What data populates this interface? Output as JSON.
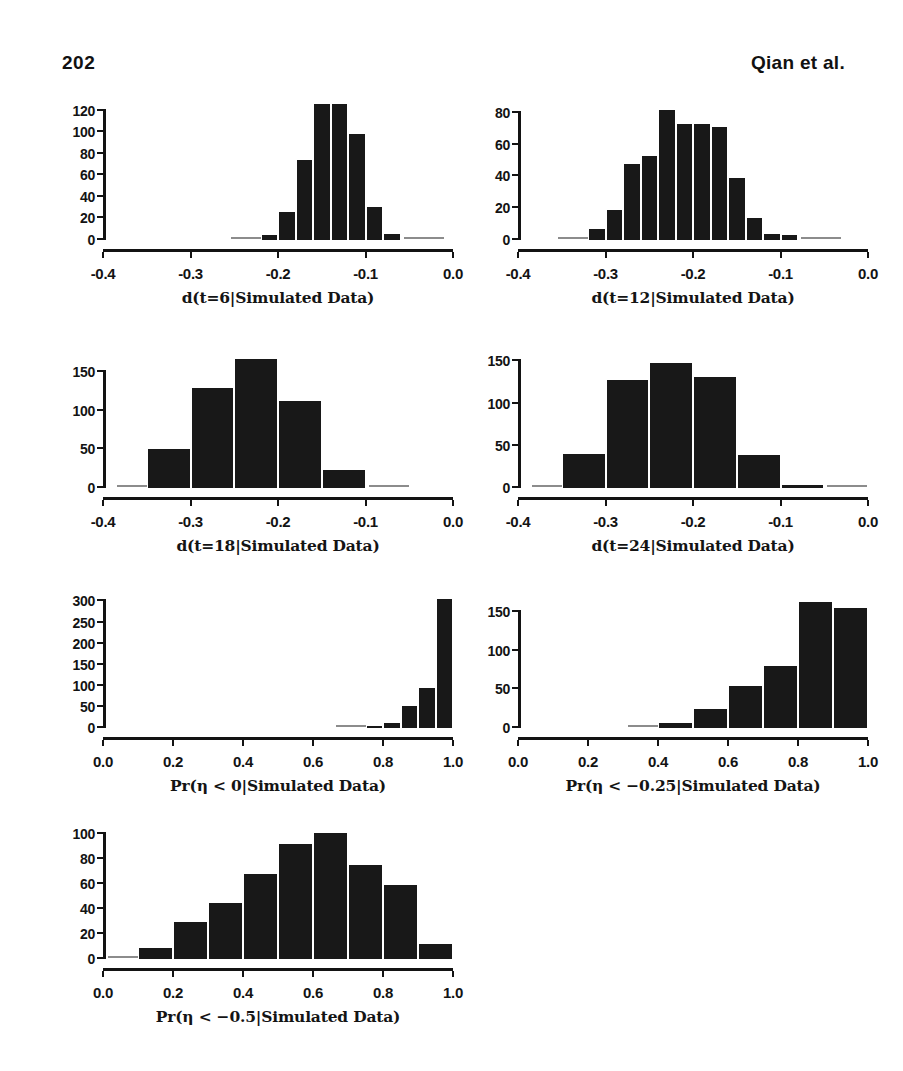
{
  "page": {
    "number": "202",
    "running_head": "Qian et al."
  },
  "chart_data": [
    {
      "id": "panel-1",
      "type": "bar",
      "title": "",
      "xlabel": "d(t=6|Simulated Data)",
      "ylabel": "",
      "xlim": [
        -0.4,
        0.0
      ],
      "ylim": [
        0,
        130
      ],
      "xticks": [
        -0.4,
        -0.3,
        -0.2,
        -0.1,
        0.0
      ],
      "xticklabels": [
        "-0.4",
        "-0.3",
        "-0.2",
        "-0.1",
        "0.0"
      ],
      "yticks": [
        0,
        20,
        40,
        60,
        80,
        100,
        120
      ],
      "yticklabels": [
        "0",
        "20",
        "40",
        "60",
        "80",
        "100",
        "120"
      ],
      "bin_width": 0.02,
      "bin_starts": [
        -0.22,
        -0.2,
        -0.18,
        -0.16,
        -0.14,
        -0.12,
        -0.1,
        -0.08
      ],
      "values": [
        5,
        26,
        74,
        126,
        126,
        98,
        31,
        6
      ],
      "grid": false,
      "legend": null
    },
    {
      "id": "panel-2",
      "type": "bar",
      "title": "",
      "xlabel": "d(t=12|Simulated Data)",
      "ylabel": "",
      "xlim": [
        -0.4,
        0.0
      ],
      "ylim": [
        0,
        88
      ],
      "xticks": [
        -0.4,
        -0.3,
        -0.2,
        -0.1,
        0.0
      ],
      "xticklabels": [
        "-0.4",
        "-0.3",
        "-0.2",
        "-0.1",
        "0.0"
      ],
      "yticks": [
        0,
        20,
        40,
        60,
        80
      ],
      "yticklabels": [
        "0",
        "20",
        "40",
        "60",
        "80"
      ],
      "bin_width": 0.02,
      "bin_starts": [
        -0.32,
        -0.3,
        -0.28,
        -0.26,
        -0.24,
        -0.22,
        -0.2,
        -0.18,
        -0.16,
        -0.14,
        -0.12,
        -0.1
      ],
      "values": [
        7,
        19,
        48,
        53,
        82,
        73,
        73,
        71,
        39,
        14,
        4,
        3
      ],
      "grid": false,
      "legend": null
    },
    {
      "id": "panel-3",
      "type": "bar",
      "title": "",
      "xlabel": "d(t=18|Simulated Data)",
      "ylabel": "",
      "xlim": [
        -0.4,
        0.0
      ],
      "ylim": [
        0,
        175
      ],
      "xticks": [
        -0.4,
        -0.3,
        -0.2,
        -0.1,
        0.0
      ],
      "xticklabels": [
        "-0.4",
        "-0.3",
        "-0.2",
        "-0.1",
        "0.0"
      ],
      "yticks": [
        0,
        50,
        100,
        150
      ],
      "yticklabels": [
        "0",
        "50",
        "100",
        "150"
      ],
      "bin_width": 0.05,
      "bin_starts": [
        -0.35,
        -0.3,
        -0.25,
        -0.2,
        -0.15
      ],
      "values": [
        50,
        130,
        167,
        113,
        23
      ],
      "grid": false,
      "legend": null
    },
    {
      "id": "panel-4",
      "type": "bar",
      "title": "",
      "xlabel": "d(t=24|Simulated Data)",
      "ylabel": "",
      "xlim": [
        -0.4,
        0.0
      ],
      "ylim": [
        0,
        160
      ],
      "xticks": [
        -0.4,
        -0.3,
        -0.2,
        -0.1,
        0.0
      ],
      "xticklabels": [
        "-0.4",
        "-0.3",
        "-0.2",
        "-0.1",
        "0.0"
      ],
      "yticks": [
        0,
        50,
        100,
        150
      ],
      "yticklabels": [
        "0",
        "50",
        "100",
        "150"
      ],
      "bin_width": 0.05,
      "bin_starts": [
        -0.35,
        -0.3,
        -0.25,
        -0.2,
        -0.15,
        -0.1
      ],
      "values": [
        40,
        128,
        148,
        131,
        39,
        3
      ],
      "grid": false,
      "legend": null
    },
    {
      "id": "panel-5",
      "type": "bar",
      "title": "",
      "xlabel": "Pr(η < 0|Simulated Data)",
      "ylabel": "",
      "xlim": [
        0.0,
        1.0
      ],
      "ylim": [
        0,
        320
      ],
      "xticks": [
        0.0,
        0.2,
        0.4,
        0.6,
        0.8,
        1.0
      ],
      "xticklabels": [
        "0.0",
        "0.2",
        "0.4",
        "0.6",
        "0.8",
        "1.0"
      ],
      "yticks": [
        0,
        50,
        100,
        150,
        200,
        250,
        300
      ],
      "yticklabels": [
        "0",
        "50",
        "100",
        "150",
        "200",
        "250",
        "300"
      ],
      "bin_width": 0.05,
      "bin_starts": [
        0.75,
        0.8,
        0.85,
        0.9,
        0.95
      ],
      "values": [
        5,
        13,
        53,
        95,
        305
      ],
      "grid": false,
      "legend": null
    },
    {
      "id": "panel-6",
      "type": "bar",
      "title": "",
      "xlabel": "Pr(η < −0.25|Simulated Data)",
      "ylabel": "",
      "xlim": [
        0.0,
        1.0
      ],
      "ylim": [
        0,
        175
      ],
      "xticks": [
        0.0,
        0.2,
        0.4,
        0.6,
        0.8,
        1.0
      ],
      "xticklabels": [
        "0.0",
        "0.2",
        "0.4",
        "0.6",
        "0.8",
        "1.0"
      ],
      "yticks": [
        0,
        50,
        100,
        150
      ],
      "yticklabels": [
        "0",
        "50",
        "100",
        "150"
      ],
      "bin_width": 0.1,
      "bin_starts": [
        0.4,
        0.5,
        0.6,
        0.7,
        0.8,
        0.9
      ],
      "values": [
        6,
        25,
        54,
        81,
        164,
        155
      ],
      "grid": false,
      "legend": null
    },
    {
      "id": "panel-7",
      "type": "bar",
      "title": "",
      "xlabel": "Pr(η < −0.5|Simulated Data)",
      "ylabel": "",
      "xlim": [
        0.0,
        1.0
      ],
      "ylim": [
        0,
        108
      ],
      "xticks": [
        0.0,
        0.2,
        0.4,
        0.6,
        0.8,
        1.0
      ],
      "xticklabels": [
        "0.0",
        "0.2",
        "0.4",
        "0.6",
        "0.8",
        "1.0"
      ],
      "yticks": [
        0,
        20,
        40,
        60,
        80,
        100
      ],
      "yticklabels": [
        "0",
        "20",
        "40",
        "60",
        "80",
        "100"
      ],
      "bin_width": 0.1,
      "bin_starts": [
        0.1,
        0.2,
        0.3,
        0.4,
        0.5,
        0.6,
        0.7,
        0.8,
        0.9
      ],
      "values": [
        9,
        30,
        45,
        68,
        92,
        101,
        75,
        59,
        12
      ],
      "grid": false,
      "legend": null
    }
  ],
  "layout": {
    "panels": [
      {
        "id": "panel-1",
        "left": 55,
        "top": 100,
        "plot_w": 350,
        "plot_h": 140
      },
      {
        "id": "panel-2",
        "left": 470,
        "top": 100,
        "plot_w": 350,
        "plot_h": 140
      },
      {
        "id": "panel-3",
        "left": 55,
        "top": 353,
        "plot_w": 350,
        "plot_h": 135
      },
      {
        "id": "panel-4",
        "left": 470,
        "top": 353,
        "plot_w": 350,
        "plot_h": 135
      },
      {
        "id": "panel-5",
        "left": 55,
        "top": 593,
        "plot_w": 350,
        "plot_h": 135
      },
      {
        "id": "panel-6",
        "left": 470,
        "top": 593,
        "plot_w": 350,
        "plot_h": 135
      },
      {
        "id": "panel-7",
        "left": 55,
        "top": 824,
        "plot_w": 350,
        "plot_h": 135
      }
    ]
  },
  "colors": {
    "bar_fill": "#181818",
    "axis": "#131313",
    "text": "#141414",
    "background": "#ffffff"
  }
}
